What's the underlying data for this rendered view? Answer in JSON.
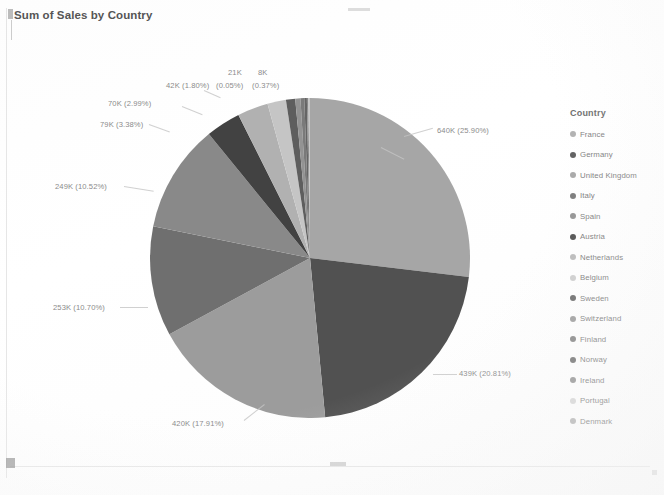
{
  "chart_title": "Sum of Sales by Country",
  "legend": {
    "title": "Country",
    "items": [
      {
        "label": "France",
        "color": "#a8a8a8"
      },
      {
        "label": "Germany",
        "color": "#4f4f4f"
      },
      {
        "label": "United Kingdom",
        "color": "#9e9e9e"
      },
      {
        "label": "Italy",
        "color": "#6e6e6e"
      },
      {
        "label": "Spain",
        "color": "#8a8a8a"
      },
      {
        "label": "Austria",
        "color": "#3f3f3f"
      },
      {
        "label": "Netherlands",
        "color": "#b4b4b4"
      },
      {
        "label": "Belgium",
        "color": "#c9c9c9"
      },
      {
        "label": "Sweden",
        "color": "#5c5c5c"
      },
      {
        "label": "Switzerland",
        "color": "#949494"
      },
      {
        "label": "Finland",
        "color": "#7a7a7a"
      },
      {
        "label": "Norway",
        "color": "#646464"
      },
      {
        "label": "Ireland",
        "color": "#888888"
      },
      {
        "label": "Portugal",
        "color": "#d0d0d0"
      },
      {
        "label": "Denmark",
        "color": "#ababab"
      }
    ]
  },
  "labels": {
    "france": "640K (25.90%)",
    "germany": "439K (20.81%)",
    "uk": "420K (17.91%)",
    "italy": "253K (10.70%)",
    "spain": "249K (10.52%)",
    "austria": "79K (3.38%)",
    "netherlands": "70K (2.99%)",
    "belgium": "42K (1.80%)",
    "sweden": "21K",
    "switzerland": "(0.05%)",
    "finland": "8K",
    "norway": "(0.37%)"
  },
  "ghost": {
    "a": "",
    "b": ""
  },
  "chart_data": {
    "type": "pie",
    "title": "Sum of Sales by Country",
    "legend_title": "Country",
    "legend_position": "right",
    "value_unit": "K",
    "categories": [
      "France",
      "Germany",
      "United Kingdom",
      "Italy",
      "Spain",
      "Austria",
      "Netherlands",
      "Belgium",
      "Sweden",
      "Switzerland",
      "Finland",
      "Norway",
      "Ireland",
      "Portugal",
      "Denmark"
    ],
    "values": [
      640,
      439,
      420,
      253,
      249,
      79,
      70,
      42,
      21,
      12,
      8,
      6,
      4,
      3,
      2
    ],
    "percentages": [
      25.9,
      20.81,
      17.91,
      10.7,
      10.52,
      3.38,
      2.99,
      1.8,
      0.9,
      0.5,
      0.37,
      0.25,
      0.15,
      0.1,
      0.05
    ],
    "data_labels": [
      "640K (25.90%)",
      "439K (20.81%)",
      "420K (17.91%)",
      "253K (10.70%)",
      "249K (10.52%)",
      "79K (3.38%)",
      "70K (2.99%)",
      "42K (1.80%)",
      "21K",
      "(0.05%)",
      "8K",
      "(0.37%)"
    ],
    "colors": [
      "#a8a8a8",
      "#4f4f4f",
      "#9e9e9e",
      "#6e6e6e",
      "#8a8a8a",
      "#3f3f3f",
      "#b4b4b4",
      "#c9c9c9",
      "#5c5c5c",
      "#949494",
      "#7a7a7a",
      "#646464",
      "#888888",
      "#d0d0d0",
      "#ababab"
    ],
    "xlabel": "",
    "ylabel": "",
    "grid": false
  }
}
